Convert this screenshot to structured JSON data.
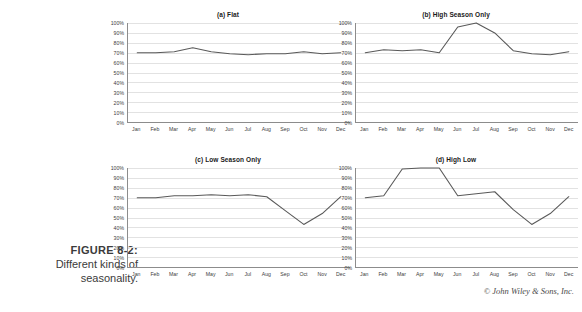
{
  "figure": {
    "label": "FIGURE 8-2:",
    "caption_line1": "Different kinds of",
    "caption_line2": "seasonality."
  },
  "credit": "© John Wiley & Sons, Inc.",
  "axis": {
    "y_ticks": [
      "100%",
      "90%",
      "80%",
      "70%",
      "60%",
      "50%",
      "40%",
      "30%",
      "20%",
      "10%",
      "0%"
    ],
    "x_ticks": [
      "Jan",
      "Feb",
      "Mar",
      "Apr",
      "May",
      "Jun",
      "Jul",
      "Aug",
      "Sep",
      "Oct",
      "Nov",
      "Dec"
    ]
  },
  "colors": {
    "line": "#595959",
    "grid": "#e2e2e2",
    "axis": "#8c8c8c",
    "text": "#231f20"
  },
  "chart_data": [
    {
      "type": "line",
      "panel": "a",
      "title": "(a) Flat",
      "categories": [
        "Jan",
        "Feb",
        "Mar",
        "Apr",
        "May",
        "Jun",
        "Jul",
        "Aug",
        "Sep",
        "Oct",
        "Nov",
        "Dec"
      ],
      "values": [
        70,
        70,
        71,
        75,
        71,
        69,
        68,
        69,
        69,
        71,
        69,
        70
      ],
      "xlabel": "",
      "ylabel": "",
      "ylim": [
        0,
        100
      ],
      "grid": true,
      "legend": "none"
    },
    {
      "type": "line",
      "panel": "b",
      "title": "(b) High Season Only",
      "categories": [
        "Jan",
        "Feb",
        "Mar",
        "Apr",
        "May",
        "Jun",
        "Jul",
        "Aug",
        "Sep",
        "Oct",
        "Nov",
        "Dec"
      ],
      "values": [
        70,
        73,
        72,
        73,
        70,
        96,
        100,
        90,
        72,
        69,
        68,
        71
      ],
      "xlabel": "",
      "ylabel": "",
      "ylim": [
        0,
        100
      ],
      "grid": true,
      "legend": "none"
    },
    {
      "type": "line",
      "panel": "c",
      "title": "(c) Low Season Only",
      "categories": [
        "Jan",
        "Feb",
        "Mar",
        "Apr",
        "May",
        "Jun",
        "Jul",
        "Aug",
        "Sep",
        "Oct",
        "Nov",
        "Dec"
      ],
      "values": [
        70,
        70,
        72,
        72,
        73,
        72,
        73,
        71,
        57,
        43,
        54,
        71
      ],
      "xlabel": "",
      "ylabel": "",
      "ylim": [
        0,
        100
      ],
      "grid": true,
      "legend": "none"
    },
    {
      "type": "line",
      "panel": "d",
      "title": "(d) High Low",
      "categories": [
        "Jan",
        "Feb",
        "Mar",
        "Apr",
        "May",
        "Jun",
        "Jul",
        "Aug",
        "Sep",
        "Oct",
        "Nov",
        "Dec"
      ],
      "values": [
        70,
        72,
        99,
        100,
        100,
        72,
        74,
        76,
        58,
        43,
        54,
        71
      ],
      "xlabel": "",
      "ylabel": "",
      "ylim": [
        0,
        100
      ],
      "grid": true,
      "legend": "none"
    }
  ]
}
